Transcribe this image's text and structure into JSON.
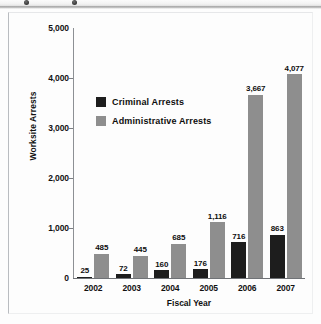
{
  "toolbar": {
    "icons": [
      "dot-icon",
      "dot-icon"
    ]
  },
  "chart_data": {
    "type": "bar",
    "title": "",
    "xlabel": "Fiscal Year",
    "ylabel": "Worksite Arrests",
    "categories": [
      "2002",
      "2003",
      "2004",
      "2005",
      "2006",
      "2007"
    ],
    "series": [
      {
        "name": "Criminal Arrests",
        "color": "#1d1d1d",
        "values": [
          25,
          72,
          160,
          176,
          716,
          863
        ],
        "labels": [
          "25",
          "72",
          "160",
          "176",
          "716",
          "863"
        ]
      },
      {
        "name": "Administrative Arrests",
        "color": "#8e8e8e",
        "values": [
          485,
          445,
          685,
          1116,
          3667,
          4077
        ],
        "labels": [
          "485",
          "445",
          "685",
          "1,116",
          "3,667",
          "4,077"
        ]
      }
    ],
    "ylim": [
      0,
      5000
    ],
    "yticks": [
      0,
      1000,
      2000,
      3000,
      4000,
      5000
    ],
    "ytick_labels": [
      "0",
      "1,000",
      "2,000",
      "3,000",
      "4,000",
      "5,000"
    ],
    "grid": false,
    "legend_position": "inside-upper-left"
  }
}
